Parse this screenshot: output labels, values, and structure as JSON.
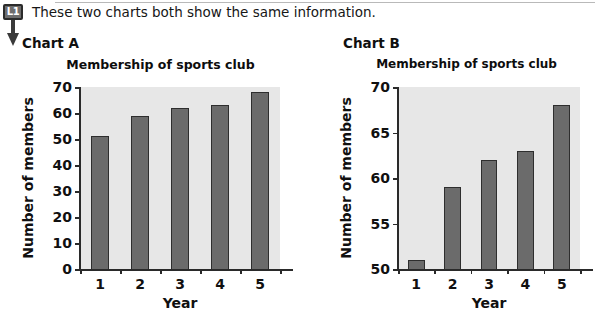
{
  "level_marker": {
    "badge_label": "L1",
    "arrow_icon": "down-arrow-icon"
  },
  "intro": {
    "text": "These two charts both show the same information."
  },
  "charts": [
    {
      "caption": "Chart A",
      "title": "Membership of sports club",
      "xlabel": "Year",
      "ylabel": "Number of members",
      "y_ticks": [
        "70",
        "60",
        "50",
        "40",
        "30",
        "20",
        "10",
        "0"
      ],
      "x_ticks": [
        "1",
        "2",
        "3",
        "4",
        "5"
      ]
    },
    {
      "caption": "Chart B",
      "title": "Membership of sports club",
      "xlabel": "Year",
      "ylabel": "Number of members",
      "y_ticks": [
        "70",
        "65",
        "60",
        "55",
        "50"
      ],
      "x_ticks": [
        "1",
        "2",
        "3",
        "4",
        "5"
      ]
    }
  ],
  "colors": {
    "bar_fill": "#6b6b6b",
    "bar_stroke": "#2e2e2e",
    "plot_background": "#e7e7e7",
    "axis": "#2a2a2a",
    "badge_fill": "#6e6e6e"
  },
  "chart_data": [
    {
      "type": "bar",
      "title": "Membership of sports club",
      "xlabel": "Year",
      "ylabel": "Number of members",
      "categories": [
        "1",
        "2",
        "3",
        "4",
        "5"
      ],
      "values": [
        51,
        59,
        62,
        63,
        68
      ],
      "ylim": [
        0,
        70
      ],
      "ytick_step": 10,
      "yticks": [
        0,
        10,
        20,
        30,
        40,
        50,
        60,
        70
      ],
      "grid": false,
      "legend": null
    },
    {
      "type": "bar",
      "title": "Membership of sports club",
      "xlabel": "Year",
      "ylabel": "Number of members",
      "categories": [
        "1",
        "2",
        "3",
        "4",
        "5"
      ],
      "values": [
        51,
        59,
        62,
        63,
        68
      ],
      "ylim": [
        50,
        70
      ],
      "ytick_step": 5,
      "yticks": [
        50,
        55,
        60,
        65,
        70
      ],
      "grid": false,
      "legend": null
    }
  ]
}
